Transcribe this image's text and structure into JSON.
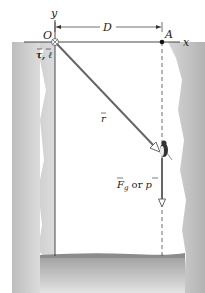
{
  "diagram": {
    "labels": {
      "y_axis": "y",
      "x_axis": "x",
      "origin": "O",
      "point_a": "A",
      "distance": "D",
      "torque_angmom": "τ, ℓ",
      "position_vector": "r",
      "force_label_main": "F",
      "force_label_sub": "g",
      "force_label_or": " or ",
      "force_label_alt": "p"
    },
    "colors": {
      "wall": "#c9c9c9",
      "wall_dark": "#b5b5b5",
      "line": "#333333",
      "vector": "#666666",
      "background": "#ffffff"
    }
  }
}
